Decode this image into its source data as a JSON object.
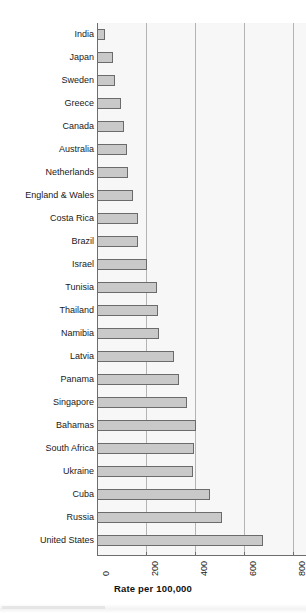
{
  "chart_data": {
    "type": "bar",
    "orientation": "horizontal",
    "title": "",
    "xlabel": "Rate per 100,000",
    "ylabel": "",
    "xlim": [
      0,
      800
    ],
    "xticks": [
      0,
      200,
      400,
      600,
      800
    ],
    "grid": true,
    "legend": false,
    "categories": [
      "India",
      "Japan",
      "Sweden",
      "Greece",
      "Canada",
      "Australia",
      "Netherlands",
      "England & Wales",
      "Costa Rica",
      "Brazil",
      "Israel",
      "Tunisia",
      "Thailand",
      "Namibia",
      "Latvia",
      "Panama",
      "Singapore",
      "Bahamas",
      "South Africa",
      "Ukraine",
      "Cuba",
      "Russia",
      "United States"
    ],
    "values": [
      33,
      66,
      74,
      98,
      110,
      122,
      127,
      147,
      167,
      168,
      204,
      245,
      249,
      253,
      314,
      335,
      367,
      404,
      396,
      392,
      461,
      510,
      677
    ]
  },
  "axis": {
    "tick_labels": [
      "0",
      "200",
      "400",
      "600",
      "800"
    ],
    "x_title": "Rate per 100,000"
  },
  "style": {
    "bar_fill": "#c9c9c9",
    "bar_stroke": "#6b6b6b",
    "plot_background": "#f7f7f7",
    "gridline_color": "#b4b4b4",
    "axis_color": "#6e6e6e",
    "text_color": "#1a1a1a"
  }
}
